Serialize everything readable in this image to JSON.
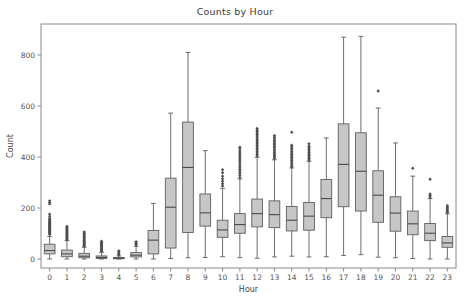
{
  "chart_data": {
    "type": "box",
    "title": "Counts by Hour",
    "xlabel": "Hour",
    "ylabel": "Count",
    "categories": [
      "0",
      "1",
      "2",
      "3",
      "4",
      "5",
      "6",
      "7",
      "8",
      "9",
      "10",
      "11",
      "12",
      "13",
      "14",
      "15",
      "16",
      "17",
      "18",
      "19",
      "20",
      "21",
      "22",
      "23"
    ],
    "xtick_labels": [
      "0",
      "1",
      "2",
      "3",
      "4",
      "5",
      "6",
      "7",
      "8",
      "9",
      "10",
      "11",
      "12",
      "13",
      "14",
      "15",
      "16",
      "17",
      "18",
      "19",
      "20",
      "21",
      "22",
      "23"
    ],
    "ytick_labels": [
      "0",
      "200",
      "400",
      "600",
      "800"
    ],
    "ytick_values": [
      0,
      200,
      400,
      600,
      800
    ],
    "ylim": [
      -30,
      890
    ],
    "grid": false,
    "legend": null,
    "box_fill_color": "#c6c6c6",
    "box_edge_color": "#5e5e5e",
    "median_color": "#4a4a4a",
    "flier_color": "#4d4d4d",
    "boxes": [
      {
        "hour": "0",
        "q1": 20,
        "median": 33,
        "q3": 58,
        "whisker_low": 0,
        "whisker_high": 88,
        "fliers": [
          96,
          101,
          104,
          108,
          112,
          115,
          118,
          121,
          124,
          127,
          130,
          133,
          136,
          139,
          142,
          146,
          150,
          155,
          160,
          168,
          176,
          216,
          222,
          228
        ]
      },
      {
        "hour": "1",
        "q1": 9,
        "median": 20,
        "q3": 35,
        "whisker_low": 0,
        "whisker_high": 72,
        "fliers": [
          76,
          80,
          84,
          88,
          92,
          96,
          100,
          104,
          108,
          112,
          116,
          120,
          124,
          128
        ]
      },
      {
        "hour": "2",
        "q1": 5,
        "median": 11,
        "q3": 22,
        "whisker_low": 0,
        "whisker_high": 46,
        "fliers": [
          50,
          54,
          58,
          62,
          66,
          70,
          74,
          78,
          82,
          86,
          90,
          95,
          100,
          106
        ]
      },
      {
        "hour": "3",
        "q1": 2,
        "median": 6,
        "q3": 12,
        "whisker_low": 0,
        "whisker_high": 26,
        "fliers": [
          30,
          34,
          38,
          42,
          46,
          50,
          54,
          58,
          62,
          66,
          70
        ]
      },
      {
        "hour": "4",
        "q1": 1,
        "median": 3,
        "q3": 6,
        "whisker_low": 0,
        "whisker_high": 12,
        "fliers": [
          16,
          20,
          24,
          28,
          32
        ]
      },
      {
        "hour": "5",
        "q1": 8,
        "median": 15,
        "q3": 25,
        "whisker_low": 0,
        "whisker_high": 50,
        "fliers": [
          55,
          60,
          64,
          68
        ]
      },
      {
        "hour": "6",
        "q1": 20,
        "median": 74,
        "q3": 112,
        "whisker_low": 0,
        "whisker_high": 218,
        "fliers": []
      },
      {
        "hour": "7",
        "q1": 43,
        "median": 203,
        "q3": 317,
        "whisker_low": 2,
        "whisker_high": 572,
        "fliers": []
      },
      {
        "hour": "8",
        "q1": 104,
        "median": 359,
        "q3": 537,
        "whisker_low": 5,
        "whisker_high": 810,
        "fliers": []
      },
      {
        "hour": "9",
        "q1": 129,
        "median": 181,
        "q3": 255,
        "whisker_low": 6,
        "whisker_high": 425,
        "fliers": []
      },
      {
        "hour": "10",
        "q1": 85,
        "median": 114,
        "q3": 152,
        "whisker_low": 9,
        "whisker_high": 277,
        "fliers": [
          286,
          295,
          305,
          315,
          325,
          338,
          350
        ]
      },
      {
        "hour": "11",
        "q1": 101,
        "median": 135,
        "q3": 178,
        "whisker_low": 5,
        "whisker_high": 314,
        "fliers": [
          320,
          328,
          336,
          344,
          352,
          360,
          368,
          376,
          384,
          392,
          400,
          408,
          416,
          424,
          432,
          438
        ]
      },
      {
        "hour": "12",
        "q1": 126,
        "median": 178,
        "q3": 235,
        "whisker_low": 3,
        "whisker_high": 399,
        "fliers": [
          404,
          410,
          416,
          422,
          428,
          434,
          440,
          446,
          452,
          458,
          464,
          470,
          476,
          482,
          488,
          494,
          500,
          506,
          512
        ]
      },
      {
        "hour": "13",
        "q1": 123,
        "median": 174,
        "q3": 228,
        "whisker_low": 8,
        "whisker_high": 389,
        "fliers": [
          394,
          400,
          406,
          412,
          418,
          424,
          430,
          436,
          442,
          448,
          454,
          460,
          466,
          472,
          478,
          484
        ]
      },
      {
        "hour": "14",
        "q1": 110,
        "median": 152,
        "q3": 206,
        "whisker_low": 11,
        "whisker_high": 357,
        "fliers": [
          362,
          368,
          374,
          380,
          386,
          392,
          398,
          404,
          410,
          416,
          422,
          428,
          434,
          440,
          446,
          497
        ]
      },
      {
        "hour": "15",
        "q1": 113,
        "median": 168,
        "q3": 222,
        "whisker_low": 8,
        "whisker_high": 383,
        "fliers": [
          388,
          394,
          400,
          406,
          412,
          418,
          424,
          430,
          436,
          442,
          452
        ]
      },
      {
        "hour": "16",
        "q1": 162,
        "median": 237,
        "q3": 312,
        "whisker_low": 9,
        "whisker_high": 475,
        "fliers": []
      },
      {
        "hour": "17",
        "q1": 205,
        "median": 371,
        "q3": 530,
        "whisker_low": 14,
        "whisker_high": 870,
        "fliers": []
      },
      {
        "hour": "18",
        "q1": 188,
        "median": 344,
        "q3": 495,
        "whisker_low": 17,
        "whisker_high": 873,
        "fliers": []
      },
      {
        "hour": "19",
        "q1": 144,
        "median": 250,
        "q3": 346,
        "whisker_low": 7,
        "whisker_high": 592,
        "fliers": [
          659
        ]
      },
      {
        "hour": "20",
        "q1": 109,
        "median": 180,
        "q3": 244,
        "whisker_low": 5,
        "whisker_high": 455,
        "fliers": []
      },
      {
        "hour": "21",
        "q1": 95,
        "median": 138,
        "q3": 188,
        "whisker_low": 2,
        "whisker_high": 325,
        "fliers": [
          356
        ]
      },
      {
        "hour": "22",
        "q1": 72,
        "median": 101,
        "q3": 139,
        "whisker_low": 0,
        "whisker_high": 237,
        "fliers": [
          243,
          249,
          255,
          313
        ]
      },
      {
        "hour": "23",
        "q1": 46,
        "median": 63,
        "q3": 88,
        "whisker_low": 0,
        "whisker_high": 177,
        "fliers": [
          182,
          187,
          192,
          197,
          203,
          209
        ]
      }
    ]
  }
}
